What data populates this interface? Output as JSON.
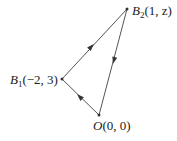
{
  "diagram": {
    "type": "vector-triangle",
    "colors": {
      "line": "#555555",
      "point": "#333333",
      "text": "#222222",
      "background": "#ffffff"
    },
    "points": [
      {
        "id": "B2",
        "name": "B",
        "subscript": "2",
        "coords": "(1, z)",
        "x": 127,
        "y": 9
      },
      {
        "id": "B1",
        "name": "B",
        "subscript": "1",
        "coords": "(−2, 3)",
        "x": 62,
        "y": 79
      },
      {
        "id": "O",
        "name": "O",
        "subscript": "",
        "coords": "(0, 0)",
        "x": 99,
        "y": 115
      }
    ],
    "edges": [
      {
        "from": "B1",
        "to": "B2",
        "arrow_direction": "toward B2"
      },
      {
        "from": "B2",
        "to": "O",
        "arrow_direction": "toward O"
      },
      {
        "from": "O",
        "to": "B1",
        "arrow_direction": "toward B1"
      }
    ],
    "labels": {
      "b2": {
        "name": "B",
        "sub": "2",
        "coords": "(1, z)"
      },
      "b1": {
        "name": "B",
        "sub": "1",
        "coords": "(−2, 3)"
      },
      "o": {
        "name": "O",
        "sub": "",
        "coords": "(0, 0)"
      }
    }
  }
}
